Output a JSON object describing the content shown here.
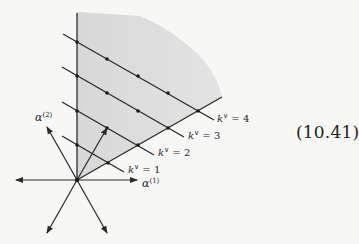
{
  "figure": {
    "equation_number": "(10.41)",
    "labels": {
      "alpha1": "α",
      "alpha1_sup": "(1)",
      "alpha2": "α",
      "alpha2_sup": "(2)",
      "k1": "k",
      "k1_sup": "∨",
      "k1_val": " = 1",
      "k2": "k",
      "k2_sup": "∨",
      "k2_val": " = 2",
      "k3": "k",
      "k3_sup": "∨",
      "k3_val": " = 3",
      "k4": "k",
      "k4_sup": "∨",
      "k4_val": " = 4"
    },
    "colors": {
      "shade": "#dcdcdc",
      "line": "#2a2a2a",
      "background": "#f7f7f5"
    },
    "origin": [
      77,
      180
    ],
    "level_lines": [
      {
        "k": 1,
        "dots": [
          [
            77,
            145
          ],
          [
            108,
            163
          ]
        ]
      },
      {
        "k": 2,
        "dots": [
          [
            77,
            111
          ],
          [
            107,
            128
          ],
          [
            138,
            145
          ]
        ]
      },
      {
        "k": 3,
        "dots": [
          [
            77,
            76
          ],
          [
            107,
            93
          ],
          [
            138,
            111
          ],
          [
            168,
            128
          ]
        ]
      },
      {
        "k": 4,
        "dots": [
          [
            77,
            42
          ],
          [
            107,
            59
          ],
          [
            138,
            76
          ],
          [
            168,
            93
          ],
          [
            198,
            111
          ]
        ]
      }
    ]
  }
}
